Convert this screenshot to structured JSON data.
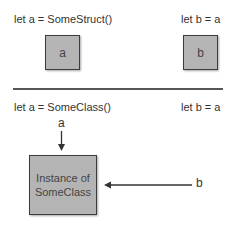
{
  "struct_section": {
    "code_a": "let a = SomeStruct()",
    "code_b": "let b = a",
    "box_a_label": "a",
    "box_b_label": "b"
  },
  "class_section": {
    "code_a": "let a = SomeClass()",
    "code_b": "let b = a",
    "ref_a_label": "a",
    "ref_b_label": "b",
    "instance_label_line1": "Instance of",
    "instance_label_line2": "SomeClass"
  },
  "colors": {
    "box_fill": "#b4b4b4",
    "box_border": "#3c3c3c",
    "line": "#555555"
  }
}
